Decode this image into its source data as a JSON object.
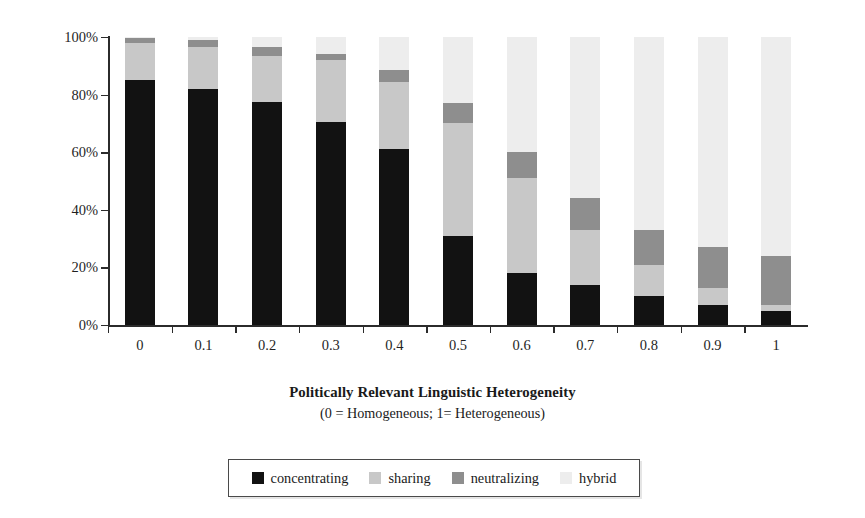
{
  "chart_data": {
    "type": "bar",
    "stacked": true,
    "title": "",
    "xlabel": "Politically Relevant Linguistic Heterogeneity",
    "xlabel_note": "(0 = Homogeneous; 1= Heterogeneous)",
    "ylabel": "Probability",
    "ylim": [
      0,
      100
    ],
    "ytick_labels": [
      "0%",
      "20%",
      "40%",
      "60%",
      "80%",
      "100%"
    ],
    "ytick_values": [
      0,
      20,
      40,
      60,
      80,
      100
    ],
    "grid": false,
    "legend_position": "bottom",
    "categories": [
      "0",
      "0.1",
      "0.2",
      "0.3",
      "0.4",
      "0.5",
      "0.6",
      "0.7",
      "0.8",
      "0.9",
      "1"
    ],
    "series": [
      {
        "name": "concentrating",
        "color": "#121212",
        "values": [
          85,
          82,
          77.5,
          70.5,
          61,
          31,
          18,
          14,
          10,
          7,
          5
        ]
      },
      {
        "name": "sharing",
        "color": "#c8c8c8",
        "values": [
          13,
          14.5,
          16,
          21.5,
          23.5,
          39,
          33,
          19,
          11,
          6,
          2
        ]
      },
      {
        "name": "neutralizing",
        "color": "#8e8e8e",
        "values": [
          1.5,
          2.5,
          3,
          2,
          4,
          7,
          9,
          11,
          12,
          14,
          17
        ]
      },
      {
        "name": "hybrid",
        "color": "#ededed",
        "values": [
          0.5,
          1,
          3.5,
          6,
          11.5,
          23,
          40,
          56,
          67,
          73,
          76
        ]
      }
    ]
  },
  "legend": {
    "items": [
      {
        "label": "concentrating",
        "color": "#121212"
      },
      {
        "label": "sharing",
        "color": "#c8c8c8"
      },
      {
        "label": "neutralizing",
        "color": "#8e8e8e"
      },
      {
        "label": "hybrid",
        "color": "#ededed"
      }
    ]
  },
  "colors": {
    "axis": "#2b2b2b",
    "text": "#1a1a1a",
    "legend_border": "#4a4a4a",
    "background": "#ffffff"
  }
}
